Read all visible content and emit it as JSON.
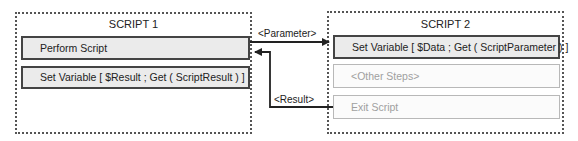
{
  "script1": {
    "title": "SCRIPT 1",
    "steps": [
      {
        "label": "Perform Script",
        "state": "active"
      },
      {
        "label": "Set Variable [ $Result ; Get ( ScriptResult ) ]",
        "state": "active"
      }
    ]
  },
  "script2": {
    "title": "SCRIPT 2",
    "steps": [
      {
        "label": "Set Variable [ $Data ; Get ( ScriptParameter ) ]",
        "state": "active"
      },
      {
        "label": "<Other Steps>",
        "state": "dim"
      },
      {
        "label": "Exit Script",
        "state": "dim"
      }
    ]
  },
  "connections": {
    "parameter_label": "<Parameter>",
    "result_label": "<Result>"
  },
  "colors": {
    "active_fill": "#ebebeb",
    "active_border": "#444444",
    "dim_border": "#b8b8b8",
    "dim_text": "#a0a0a0",
    "arrow": "#222222"
  }
}
